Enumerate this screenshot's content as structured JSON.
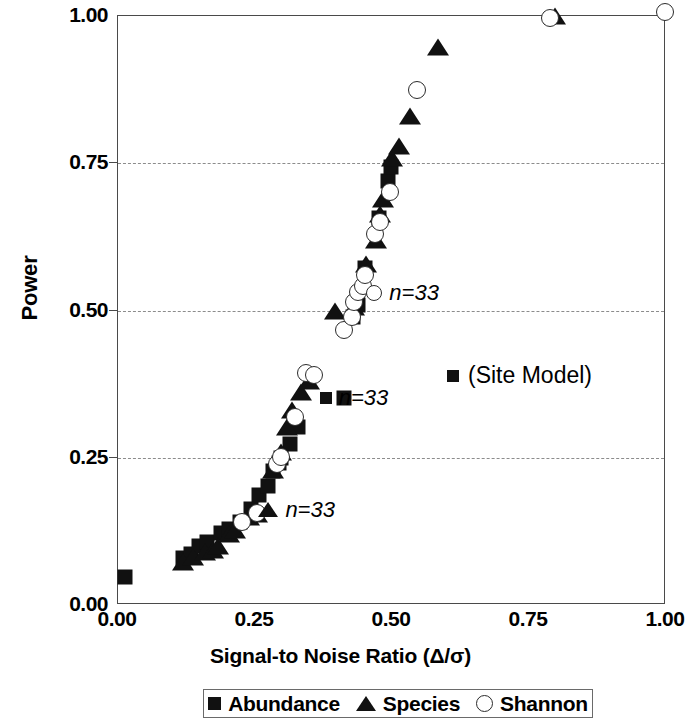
{
  "chart_data": {
    "type": "scatter",
    "title": "",
    "xlabel": "Signal-to Noise Ratio (Δ/σ)",
    "ylabel": "Power",
    "xlim": [
      0.0,
      1.0
    ],
    "ylim": [
      0.0,
      1.0
    ],
    "xticks": [
      "0.00",
      "0.25",
      "0.50",
      "0.75",
      "1.00"
    ],
    "xtick_values": [
      0.0,
      0.25,
      0.5,
      0.75,
      1.0
    ],
    "yticks": [
      "0.00",
      "0.25",
      "0.50",
      "0.75",
      "1.00"
    ],
    "ytick_values": [
      0.0,
      0.25,
      0.5,
      0.75,
      1.0
    ],
    "grid": "horizontal-dashed",
    "gridlines_y": [
      0.25,
      0.5,
      0.75
    ],
    "legend_position": "below-axis",
    "legend": [
      {
        "label": "Abundance",
        "marker": "square"
      },
      {
        "label": "Species",
        "marker": "triangle"
      },
      {
        "label": "Shannon",
        "marker": "circle"
      }
    ],
    "series": [
      {
        "name": "Abundance",
        "marker": "square",
        "points": [
          [
            0.015,
            0.045
          ],
          [
            0.12,
            0.078
          ],
          [
            0.135,
            0.085
          ],
          [
            0.15,
            0.098
          ],
          [
            0.165,
            0.105
          ],
          [
            0.19,
            0.12
          ],
          [
            0.205,
            0.128
          ],
          [
            0.225,
            0.14
          ],
          [
            0.245,
            0.162
          ],
          [
            0.26,
            0.185
          ],
          [
            0.275,
            0.2
          ],
          [
            0.285,
            0.225
          ],
          [
            0.295,
            0.24
          ],
          [
            0.3,
            0.248
          ],
          [
            0.315,
            0.272
          ],
          [
            0.33,
            0.3
          ],
          [
            0.415,
            0.35
          ],
          [
            0.43,
            0.488
          ],
          [
            0.44,
            0.508
          ],
          [
            0.452,
            0.57
          ],
          [
            0.478,
            0.655
          ],
          [
            0.495,
            0.718
          ],
          [
            0.5,
            0.742
          ]
        ]
      },
      {
        "name": "Species",
        "marker": "triangle",
        "points": [
          [
            0.12,
            0.072
          ],
          [
            0.138,
            0.08
          ],
          [
            0.16,
            0.088
          ],
          [
            0.175,
            0.092
          ],
          [
            0.185,
            0.098
          ],
          [
            0.205,
            0.118
          ],
          [
            0.215,
            0.125
          ],
          [
            0.24,
            0.148
          ],
          [
            0.255,
            0.152
          ],
          [
            0.285,
            0.228
          ],
          [
            0.3,
            0.258
          ],
          [
            0.31,
            0.3
          ],
          [
            0.32,
            0.33
          ],
          [
            0.335,
            0.36
          ],
          [
            0.35,
            0.378
          ],
          [
            0.398,
            0.498
          ],
          [
            0.432,
            0.505
          ],
          [
            0.455,
            0.578
          ],
          [
            0.472,
            0.618
          ],
          [
            0.48,
            0.662
          ],
          [
            0.485,
            0.688
          ],
          [
            0.502,
            0.758
          ],
          [
            0.515,
            0.778
          ],
          [
            0.535,
            0.828
          ],
          [
            0.585,
            0.945
          ],
          [
            0.8,
            0.998
          ]
        ]
      },
      {
        "name": "Shannon",
        "marker": "circle",
        "points": [
          [
            0.228,
            0.14
          ],
          [
            0.255,
            0.155
          ],
          [
            0.292,
            0.238
          ],
          [
            0.3,
            0.25
          ],
          [
            0.325,
            0.318
          ],
          [
            0.345,
            0.392
          ],
          [
            0.36,
            0.388
          ],
          [
            0.415,
            0.465
          ],
          [
            0.428,
            0.488
          ],
          [
            0.432,
            0.512
          ],
          [
            0.44,
            0.53
          ],
          [
            0.448,
            0.54
          ],
          [
            0.452,
            0.558
          ],
          [
            0.47,
            0.628
          ],
          [
            0.48,
            0.648
          ],
          [
            0.498,
            0.7
          ],
          [
            0.548,
            0.872
          ],
          [
            0.79,
            0.995
          ],
          [
            1.0,
            1.005
          ]
        ]
      }
    ],
    "annotations": [
      {
        "id": "n-label-shannon",
        "text": "n=33",
        "marker": "circle",
        "x": 0.455,
        "y": 0.528
      },
      {
        "id": "n-label-abundance",
        "text": "n=33",
        "marker": "square",
        "x": 0.37,
        "y": 0.35
      },
      {
        "id": "n-label-species",
        "text": "n=33",
        "marker": "triangle",
        "x": 0.258,
        "y": 0.16
      },
      {
        "id": "site-model-label",
        "text": "(Site Model)",
        "marker": "square",
        "x": 0.61,
        "y": 0.415
      }
    ]
  },
  "colors": {
    "marker_fill": "#111111",
    "marker_outline": "#2b2b2b",
    "axis": "#4a4a4a",
    "gridline": "#8c8c8c",
    "background": "#ffffff"
  }
}
